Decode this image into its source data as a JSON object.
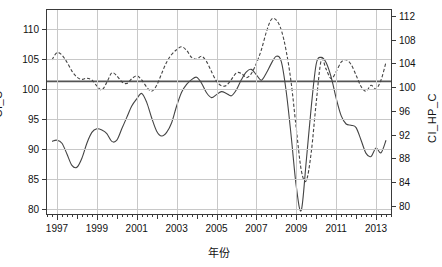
{
  "chart_data": {
    "type": "line",
    "title": "",
    "xlabel": "年份",
    "ylabel_left": "CI_C",
    "ylabel_right": "CI_HP_C",
    "xlim": [
      1996.5,
      2013.75
    ],
    "ylim_left": [
      79.2,
      113.2
    ],
    "ylim_right": [
      78.6,
      113.0
    ],
    "grid": true,
    "legend": "none",
    "x_tick_labels": [
      "1997",
      "1999",
      "2001",
      "2003",
      "2005",
      "2007",
      "2009",
      "2011",
      "2013"
    ],
    "x_tick_values": [
      1997,
      1999,
      2001,
      2003,
      2005,
      2007,
      2009,
      2011,
      2013
    ],
    "x_minor_tick_interval_months": 3,
    "y_left_tick_labels": [
      "110",
      "105",
      "100",
      "95",
      "90",
      "85",
      "80"
    ],
    "y_left_tick_values": [
      110,
      105,
      100,
      95,
      90,
      85,
      80
    ],
    "y_right_tick_labels": [
      "112",
      "108",
      "104",
      "100",
      "96",
      "92",
      "88",
      "84",
      "80"
    ],
    "y_right_tick_values": [
      112,
      108,
      104,
      100,
      96,
      92,
      88,
      84,
      80
    ],
    "reference_line": {
      "axis": "left",
      "value": 101.3,
      "style": "solid",
      "color": "#555555"
    },
    "series": [
      {
        "name": "CI_C",
        "axis": "left",
        "style": "solid",
        "color": "#444444",
        "x": [
          1996.75,
          1997.0,
          1997.25,
          1997.5,
          1997.75,
          1998.0,
          1998.25,
          1998.5,
          1998.75,
          1999.0,
          1999.25,
          1999.5,
          1999.75,
          2000.0,
          2000.25,
          2000.5,
          2000.75,
          2001.0,
          2001.25,
          2001.5,
          2001.75,
          2002.0,
          2002.25,
          2002.5,
          2002.75,
          2003.0,
          2003.25,
          2003.5,
          2003.75,
          2004.0,
          2004.25,
          2004.5,
          2004.75,
          2005.0,
          2005.25,
          2005.5,
          2005.75,
          2006.0,
          2006.25,
          2006.5,
          2006.75,
          2007.0,
          2007.25,
          2007.5,
          2007.75,
          2008.0,
          2008.25,
          2008.5,
          2008.75,
          2009.0,
          2009.25,
          2009.5,
          2009.75,
          2010.0,
          2010.25,
          2010.5,
          2010.75,
          2011.0,
          2011.25,
          2011.5,
          2011.75,
          2012.0,
          2012.25,
          2012.5,
          2012.75,
          2013.0,
          2013.25,
          2013.5
        ],
        "y": [
          91.3,
          91.5,
          91.0,
          89.2,
          87.3,
          87.0,
          88.5,
          91.0,
          92.8,
          93.4,
          93.2,
          92.6,
          91.3,
          91.5,
          93.4,
          95.3,
          97.2,
          98.4,
          99.3,
          97.8,
          95.2,
          93.0,
          92.2,
          92.8,
          94.4,
          97.2,
          99.5,
          100.8,
          101.6,
          102.0,
          101.0,
          99.4,
          98.6,
          99.1,
          99.6,
          99.3,
          98.9,
          99.9,
          101.6,
          102.9,
          103.3,
          102.4,
          101.5,
          102.7,
          104.3,
          105.5,
          104.6,
          99.5,
          92.0,
          83.8,
          79.8,
          88.0,
          97.0,
          104.2,
          105.3,
          104.4,
          102.0,
          98.5,
          95.6,
          94.2,
          94.0,
          93.6,
          91.5,
          89.3,
          88.8,
          90.2,
          89.4,
          91.5
        ]
      },
      {
        "name": "CI_HP_C",
        "axis": "right",
        "style": "dashed",
        "color": "#444444",
        "x": [
          1996.75,
          1997.0,
          1997.25,
          1997.5,
          1997.75,
          1998.0,
          1998.25,
          1998.5,
          1998.75,
          1999.0,
          1999.25,
          1999.5,
          1999.75,
          2000.0,
          2000.25,
          2000.5,
          2000.75,
          2001.0,
          2001.25,
          2001.5,
          2001.75,
          2002.0,
          2002.25,
          2002.5,
          2002.75,
          2003.0,
          2003.25,
          2003.5,
          2003.75,
          2004.0,
          2004.25,
          2004.5,
          2004.75,
          2005.0,
          2005.25,
          2005.5,
          2005.75,
          2006.0,
          2006.25,
          2006.5,
          2006.75,
          2007.0,
          2007.25,
          2007.5,
          2007.75,
          2008.0,
          2008.25,
          2008.5,
          2008.75,
          2009.0,
          2009.25,
          2009.5,
          2009.75,
          2010.0,
          2010.25,
          2010.5,
          2010.75,
          2011.0,
          2011.25,
          2011.5,
          2011.75,
          2012.0,
          2012.25,
          2012.5,
          2012.75,
          2013.0,
          2013.25,
          2013.5
        ],
        "y": [
          104.6,
          105.8,
          105.4,
          104.2,
          102.7,
          101.7,
          101.3,
          101.5,
          101.2,
          100.2,
          99.5,
          100.8,
          102.4,
          101.9,
          100.9,
          100.6,
          101.4,
          101.9,
          101.2,
          100.0,
          99.3,
          100.3,
          102.3,
          104.2,
          105.5,
          106.3,
          106.8,
          106.2,
          105.0,
          104.7,
          105.2,
          104.3,
          102.6,
          101.0,
          100.2,
          100.3,
          101.3,
          102.4,
          102.3,
          101.6,
          102.3,
          104.0,
          106.3,
          109.3,
          111.4,
          111.3,
          109.6,
          106.0,
          100.6,
          93.0,
          86.0,
          84.2,
          89.0,
          97.4,
          104.5,
          103.0,
          101.4,
          102.6,
          104.2,
          104.6,
          103.8,
          102.0,
          100.1,
          99.3,
          100.3,
          99.7,
          101.2,
          104.2
        ]
      }
    ]
  },
  "axes": {
    "left_label": "CI_C",
    "right_label": "CI_HP_C",
    "x_label": "年份"
  }
}
